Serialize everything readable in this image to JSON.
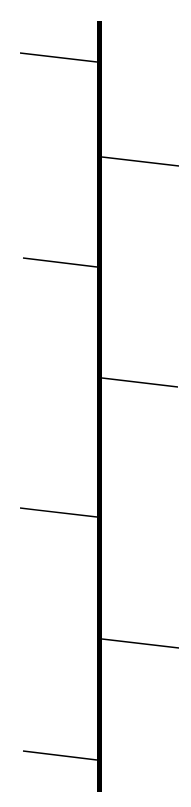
{
  "diagram": {
    "background": "#ffffff",
    "stroke_color": "#000000",
    "trunk": {
      "x": 99.5,
      "y1": 21,
      "y2": 792,
      "width": 5
    },
    "branch_width": 1.3,
    "branches": [
      {
        "side": "left",
        "x1": 20,
        "y1": 53,
        "x2": 97,
        "y2": 62
      },
      {
        "side": "right",
        "x1": 102,
        "y1": 157,
        "x2": 179,
        "y2": 166
      },
      {
        "side": "left",
        "x1": 23,
        "y1": 258,
        "x2": 97,
        "y2": 267
      },
      {
        "side": "right",
        "x1": 102,
        "y1": 378,
        "x2": 178,
        "y2": 387
      },
      {
        "side": "left",
        "x1": 20,
        "y1": 508,
        "x2": 97,
        "y2": 517
      },
      {
        "side": "right",
        "x1": 102,
        "y1": 639,
        "x2": 179,
        "y2": 648
      },
      {
        "side": "left",
        "x1": 23,
        "y1": 751,
        "x2": 97,
        "y2": 760
      }
    ]
  }
}
